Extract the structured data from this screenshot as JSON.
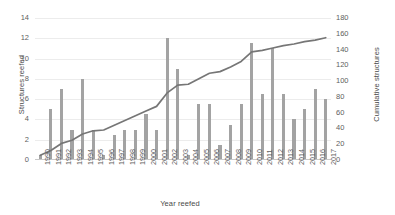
{
  "chart_data": {
    "type": "bar",
    "title": "",
    "xlabel": "Year reefed",
    "ylabel": "Structures reefed",
    "y2label": "Cumulative structures",
    "grid": true,
    "legend": "none",
    "ylim": [
      0,
      14
    ],
    "y2lim": [
      0,
      180
    ],
    "yticks": [
      0,
      2,
      4,
      6,
      8,
      10,
      12,
      14
    ],
    "y2ticks": [
      0,
      20,
      40,
      60,
      80,
      100,
      120,
      140,
      160,
      180
    ],
    "categories": [
      "1990",
      "1991",
      "1992",
      "1993",
      "1994",
      "1995",
      "1996",
      "1997",
      "1998",
      "1999",
      "2000",
      "2001",
      "2002",
      "2003",
      "2004",
      "2005",
      "2006",
      "2007",
      "2008",
      "2009",
      "2010",
      "2011",
      "2012",
      "2013",
      "2014",
      "2015",
      "2016",
      "2017"
    ],
    "series": [
      {
        "name": "Structures reefed",
        "type": "bar",
        "axis": "left",
        "color": "#a3a3a3",
        "values": [
          0.5,
          5,
          7,
          3,
          8,
          3,
          0.5,
          2.5,
          3,
          3,
          4.5,
          3,
          12,
          9,
          0.5,
          5.5,
          5.5,
          1.5,
          3.5,
          5.5,
          11.5,
          6.5,
          11,
          6.5,
          4,
          5,
          7,
          6
        ]
      },
      {
        "name": "Cumulative structures",
        "type": "line",
        "axis": "right",
        "color": "#767676",
        "values": [
          6,
          12,
          21,
          25,
          33,
          37,
          38,
          44,
          50,
          56,
          62,
          68,
          85,
          95,
          96,
          103,
          110,
          112,
          118,
          125,
          137,
          139,
          142,
          145,
          147,
          150,
          152,
          155
        ]
      }
    ]
  }
}
